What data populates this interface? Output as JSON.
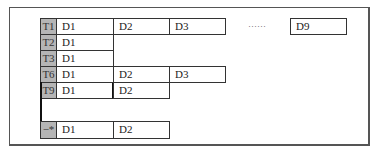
{
  "diagram": {
    "ellipsis": "……",
    "rows": [
      {
        "tag": "T1",
        "cells": [
          "D1",
          "D2",
          "D3"
        ],
        "last": "D9"
      },
      {
        "tag": "T2",
        "cells": [
          "D1"
        ]
      },
      {
        "tag": "T3",
        "cells": [
          "D1"
        ]
      },
      {
        "tag": "T6",
        "cells": [
          "D1",
          "D2",
          "D3"
        ]
      },
      {
        "tag": "T9",
        "cells": [
          "D1",
          "D2"
        ]
      },
      {
        "tag": "−*",
        "cells": [
          "D1",
          "D2"
        ]
      }
    ],
    "colors": {
      "tag_fill": "#b5b5b5",
      "border": "#333333",
      "frame": "#555555"
    }
  }
}
